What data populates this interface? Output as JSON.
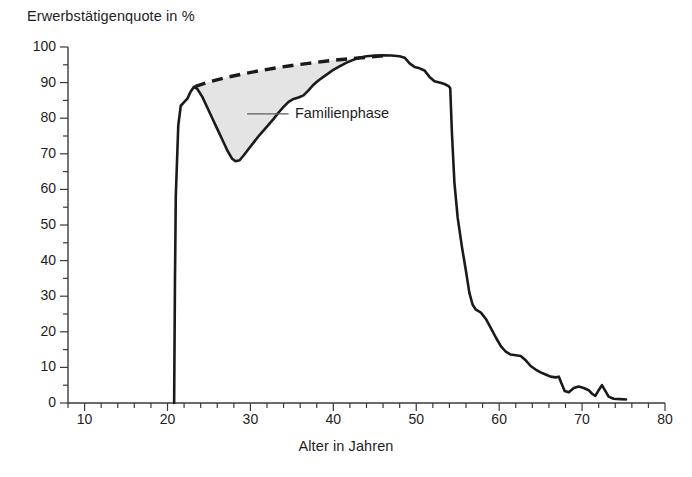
{
  "chart_data": {
    "type": "line",
    "title": "",
    "ylabel": "Erwerbstätigenquote in %",
    "xlabel": "Alter in Jahren",
    "xlim": [
      8,
      80
    ],
    "ylim": [
      0,
      100
    ],
    "x_ticks": [
      10,
      20,
      30,
      40,
      50,
      60,
      70,
      80
    ],
    "y_ticks": [
      0,
      10,
      20,
      30,
      40,
      50,
      60,
      70,
      80,
      90,
      100
    ],
    "x_minor_step": 2,
    "y_minor_step": 5,
    "grid": false,
    "legend": "none",
    "annotations": [
      {
        "text": "Familienphase",
        "x_value": 35.0,
        "y_value": 81.0,
        "leader_from_x": 29.6,
        "leader_to_x": 34.6,
        "leader_y": 81.2
      }
    ],
    "series": [
      {
        "name": "Erwerbstätigenquote (tatsächlich)",
        "style": "solid",
        "color": "#1a1a1a",
        "points": [
          [
            20.8,
            0
          ],
          [
            20.9,
            34
          ],
          [
            21.0,
            58
          ],
          [
            21.3,
            78
          ],
          [
            21.6,
            83.5
          ],
          [
            22.0,
            84.5
          ],
          [
            22.4,
            85.5
          ],
          [
            22.8,
            87.5
          ],
          [
            23.2,
            88.8
          ],
          [
            23.6,
            88.2
          ],
          [
            24.2,
            86.0
          ],
          [
            24.8,
            83.0
          ],
          [
            25.4,
            80.0
          ],
          [
            26.0,
            77.0
          ],
          [
            26.6,
            74.0
          ],
          [
            27.2,
            71.0
          ],
          [
            27.8,
            68.6
          ],
          [
            28.2,
            67.9
          ],
          [
            28.7,
            68.2
          ],
          [
            29.2,
            69.6
          ],
          [
            29.8,
            71.4
          ],
          [
            30.4,
            73.2
          ],
          [
            31.0,
            75.0
          ],
          [
            31.6,
            76.6
          ],
          [
            32.2,
            78.2
          ],
          [
            32.8,
            79.8
          ],
          [
            33.4,
            81.6
          ],
          [
            34.0,
            83.2
          ],
          [
            34.6,
            84.6
          ],
          [
            35.2,
            85.4
          ],
          [
            35.8,
            85.8
          ],
          [
            36.4,
            86.4
          ],
          [
            37.0,
            87.8
          ],
          [
            37.6,
            89.4
          ],
          [
            38.2,
            90.6
          ],
          [
            38.8,
            91.6
          ],
          [
            39.4,
            92.6
          ],
          [
            40.0,
            93.6
          ],
          [
            40.8,
            94.6
          ],
          [
            41.6,
            95.6
          ],
          [
            42.4,
            96.4
          ],
          [
            43.2,
            97.0
          ],
          [
            44.0,
            97.4
          ],
          [
            45.0,
            97.6
          ],
          [
            46.0,
            97.7
          ],
          [
            47.0,
            97.6
          ],
          [
            48.0,
            97.4
          ],
          [
            48.6,
            97.0
          ],
          [
            49.2,
            95.4
          ],
          [
            49.8,
            94.4
          ],
          [
            50.4,
            94.0
          ],
          [
            51.0,
            93.4
          ],
          [
            51.6,
            91.6
          ],
          [
            52.2,
            90.4
          ],
          [
            52.8,
            90.0
          ],
          [
            53.4,
            89.6
          ],
          [
            53.9,
            89.0
          ],
          [
            54.1,
            88.4
          ],
          [
            54.3,
            76.0
          ],
          [
            54.6,
            62.0
          ],
          [
            55.0,
            52.0
          ],
          [
            55.5,
            44.0
          ],
          [
            56.0,
            37.0
          ],
          [
            56.4,
            31.0
          ],
          [
            56.8,
            27.6
          ],
          [
            57.2,
            26.2
          ],
          [
            57.8,
            25.4
          ],
          [
            58.4,
            23.6
          ],
          [
            59.0,
            21.0
          ],
          [
            59.6,
            18.4
          ],
          [
            60.2,
            16.0
          ],
          [
            60.8,
            14.4
          ],
          [
            61.4,
            13.6
          ],
          [
            62.0,
            13.4
          ],
          [
            62.6,
            13.2
          ],
          [
            63.2,
            12.0
          ],
          [
            63.8,
            10.4
          ],
          [
            64.4,
            9.4
          ],
          [
            65.0,
            8.6
          ],
          [
            65.6,
            8.0
          ],
          [
            66.2,
            7.4
          ],
          [
            66.8,
            7.2
          ],
          [
            67.2,
            7.4
          ],
          [
            67.5,
            5.6
          ],
          [
            67.9,
            3.4
          ],
          [
            68.4,
            3.0
          ],
          [
            69.0,
            4.2
          ],
          [
            69.6,
            4.6
          ],
          [
            70.2,
            4.2
          ],
          [
            70.8,
            3.6
          ],
          [
            71.2,
            2.6
          ],
          [
            71.6,
            2.0
          ],
          [
            72.0,
            3.6
          ],
          [
            72.4,
            5.0
          ],
          [
            72.8,
            3.4
          ],
          [
            73.2,
            1.8
          ],
          [
            73.8,
            1.2
          ],
          [
            74.6,
            1.1
          ],
          [
            75.3,
            1.0
          ]
        ]
      },
      {
        "name": "Hypothetischer Verlauf ohne Familienphase",
        "style": "dashed",
        "color": "#1a1a1a",
        "points": [
          [
            23.3,
            88.9
          ],
          [
            25.0,
            90.2
          ],
          [
            27.0,
            91.4
          ],
          [
            29.0,
            92.4
          ],
          [
            31.0,
            93.3
          ],
          [
            33.0,
            94.1
          ],
          [
            35.0,
            94.8
          ],
          [
            37.0,
            95.4
          ],
          [
            39.0,
            96.0
          ],
          [
            41.0,
            96.5
          ],
          [
            43.0,
            96.9
          ],
          [
            44.5,
            97.2
          ],
          [
            46.0,
            97.5
          ]
        ]
      }
    ],
    "shaded_region": {
      "name": "Familienphase",
      "fill_color": "#e4e4e4",
      "between": [
        "Hypothetischer Verlauf ohne Familienphase",
        "Erwerbstätigenquote (tatsächlich)"
      ],
      "x_start": 23.3,
      "x_end": 44.5
    },
    "axis_color": "#3a3a3a",
    "line_color": "#1a1a1a"
  }
}
